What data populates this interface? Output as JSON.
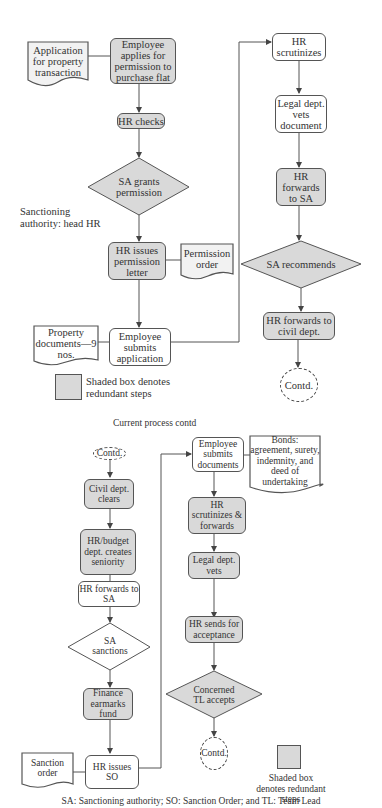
{
  "part1": {
    "application_doc": "Application for property transaction",
    "employee_applies": "Employee applies for permission to purchase flat",
    "hr_checks": "HR checks",
    "sa_grants": "SA grants permission",
    "sanction_note": "Sanctioning authority: head HR",
    "hr_issues_letter": "HR issues permission letter",
    "permission_order": "Permission order",
    "property_docs": "Property documents—9 nos.",
    "employee_submits": "Employee submits application",
    "hr_scrutinizes": "HR scrutinizes",
    "legal_vets": "Legal dept. vets document",
    "hr_forwards_sa": "HR forwards to SA",
    "sa_recommends": "SA recommends",
    "hr_forwards_civil": "HR forwards to civil dept.",
    "contd": "Contd.",
    "legend": "Shaded box denotes redundant steps"
  },
  "section_title": "Current process contd",
  "part2": {
    "contd_in": "Contd.",
    "civil_clears": "Civil dept. clears",
    "hr_budget": "HR/budget dept. creates seniority",
    "hr_forwards_sa": "HR forwards to SA",
    "sa_sanctions": "SA sanctions",
    "finance": "Finance earmarks fund",
    "hr_issues_so": "HR issues SO",
    "sanction_order": "Sanction order",
    "employee_submits_docs": "Employee submits documents",
    "bonds": "Bonds: agreement, surety, indemnity, and deed of undertaking",
    "hr_scrutinizes_fwd": "HR scrutinizes & forwards",
    "legal_vets": "Legal dept. vets",
    "hr_sends": "HR sends for acceptance",
    "tl_accepts": "Concerned TL accepts",
    "contd_out": "Contd.",
    "legend": "Shaded box denotes redundant steps"
  },
  "footnote": "SA: Sanctioning authority; SO: Sanction Order; and TL: Team Lead",
  "colors": {
    "shaded": "#d9d9d9",
    "stroke": "#555555"
  }
}
